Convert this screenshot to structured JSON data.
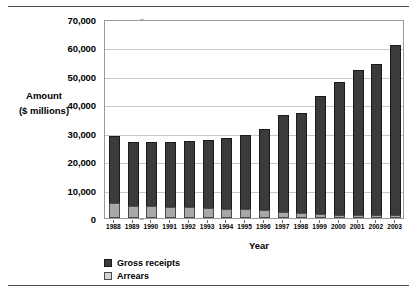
{
  "chart_data": {
    "type": "bar",
    "subtype": "stacked-column",
    "title": "",
    "xlabel": "Year",
    "ylabel": "Amount\n($ millions)",
    "ylabel_lines": [
      "Amount",
      "($ millions)"
    ],
    "ylim": [
      0,
      70000
    ],
    "ytick_labels": [
      "0",
      "10,000",
      "20,000",
      "30,000",
      "40,000",
      "50,000",
      "60,000",
      "70,000"
    ],
    "ytick_values": [
      0,
      10000,
      20000,
      30000,
      40000,
      50000,
      60000,
      70000
    ],
    "grid": true,
    "legend_position": "bottom-left",
    "categories": [
      "1988",
      "1989",
      "1990",
      "1991",
      "1992",
      "1993",
      "1994",
      "1995",
      "1996",
      "1997",
      "1998",
      "1999",
      "2000",
      "2001",
      "2002",
      "2003"
    ],
    "series": [
      {
        "name": "Arrears",
        "color": "#a8a8a8",
        "values": [
          5300,
          4400,
          4100,
          3900,
          3700,
          3500,
          3300,
          3100,
          2900,
          2100,
          1600,
          1300,
          1200,
          1100,
          1000,
          1000
        ]
      },
      {
        "name": "Gross receipts",
        "color": "#3b3b3b",
        "values": [
          23600,
          22200,
          22700,
          22900,
          23400,
          24000,
          25000,
          26000,
          28300,
          34000,
          35300,
          41700,
          46600,
          51000,
          53100,
          59900
        ]
      }
    ],
    "totals": [
      28900,
      26600,
      26800,
      26800,
      27100,
      27500,
      28300,
      29100,
      31200,
      36100,
      36900,
      43000,
      47800,
      52100,
      54100,
      60900
    ]
  },
  "legend": {
    "items": [
      {
        "label": "Gross receipts",
        "key": "receipts"
      },
      {
        "label": "Arrears",
        "key": "arrears"
      }
    ]
  },
  "axis": {
    "x_title": "Year",
    "y_title_line1": "Amount",
    "y_title_line2": "($ millions)"
  }
}
